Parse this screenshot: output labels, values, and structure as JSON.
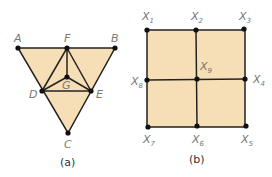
{
  "colors": {
    "fill": "#f6dfb6",
    "stroke": "#222222",
    "label": "#777777"
  },
  "figure_a": {
    "caption": "(a)",
    "labels": {
      "A": "A",
      "B": "B",
      "C": "C",
      "D": "D",
      "E": "E",
      "F": "F",
      "G": "G"
    }
  },
  "figure_b": {
    "caption": "(b)",
    "labels": {
      "x1": "X",
      "x1s": "1",
      "x2": "X",
      "x2s": "2",
      "x3": "X",
      "x3s": "3",
      "x4": "X",
      "x4s": "4",
      "x5": "X",
      "x5s": "5",
      "x6": "X",
      "x6s": "6",
      "x7": "X",
      "x7s": "7",
      "x8": "X",
      "x8s": "8",
      "x9": "X",
      "x9s": "9"
    }
  }
}
